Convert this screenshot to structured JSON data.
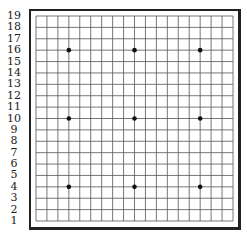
{
  "board": {
    "size": 19,
    "row_labels": [
      "19",
      "18",
      "17",
      "16",
      "15",
      "14",
      "13",
      "12",
      "11",
      "10",
      "9",
      "8",
      "7",
      "6",
      "5",
      "4",
      "3",
      "2",
      "1"
    ],
    "star_points": [
      {
        "col": 4,
        "row": 16
      },
      {
        "col": 10,
        "row": 16
      },
      {
        "col": 16,
        "row": 16
      },
      {
        "col": 4,
        "row": 10
      },
      {
        "col": 10,
        "row": 10
      },
      {
        "col": 16,
        "row": 10
      },
      {
        "col": 4,
        "row": 4
      },
      {
        "col": 10,
        "row": 4
      },
      {
        "col": 16,
        "row": 4
      }
    ],
    "colors": {
      "line": "#555555",
      "frame": "#222222",
      "star": "#111111",
      "background": "#ffffff"
    }
  }
}
